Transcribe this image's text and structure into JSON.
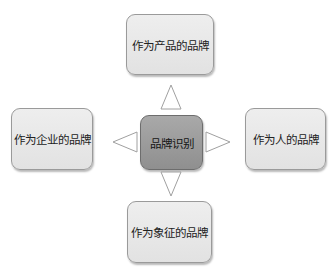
{
  "diagram": {
    "type": "hub-and-spoke",
    "center": {
      "label": "品牌识别",
      "fill": "#9c9c9c"
    },
    "nodes": [
      {
        "id": "top",
        "label": "作为产品的品牌",
        "position": "top"
      },
      {
        "id": "left",
        "label": "作为企业的品牌",
        "position": "left"
      },
      {
        "id": "right",
        "label": "作为人的品牌",
        "position": "right"
      },
      {
        "id": "bottom",
        "label": "作为象征的品牌",
        "position": "bottom"
      }
    ],
    "connectors": [
      {
        "shape": "triangle-outline",
        "direction": "up"
      },
      {
        "shape": "triangle-outline",
        "direction": "left"
      },
      {
        "shape": "triangle-outline",
        "direction": "right"
      },
      {
        "shape": "triangle-outline",
        "direction": "down"
      }
    ],
    "colors": {
      "node_fill": "#e8e8e8",
      "center_fill": "#9c9c9c",
      "border": "#9a9a9a",
      "arrow_stroke": "#a0a0a0"
    }
  }
}
